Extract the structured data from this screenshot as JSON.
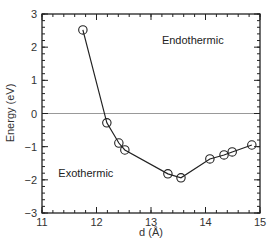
{
  "chart_data": {
    "type": "line",
    "title": "",
    "xlabel": "d (Å)",
    "ylabel": "Energy (eV)",
    "xlim": [
      11,
      15
    ],
    "ylim": [
      -3,
      3
    ],
    "xticks": [
      11,
      12,
      13,
      14,
      15
    ],
    "yticks": [
      -3,
      -2,
      -1,
      0,
      1,
      2,
      3
    ],
    "x_minor_step": 0.2,
    "y_minor_step": 0.2,
    "grid": false,
    "reference_line": {
      "y": 0,
      "color": "#999999"
    },
    "annotations": [
      {
        "text": "Endothermic",
        "x": 13.2,
        "y": 2.0
      },
      {
        "text": "Exothermic",
        "x": 11.3,
        "y": -2.0
      }
    ],
    "series": [
      {
        "name": "Energy",
        "marker": "open-circle",
        "color": "#222222",
        "x": [
          11.75,
          12.19,
          12.41,
          12.52,
          13.31,
          13.55,
          14.08,
          14.34,
          14.49,
          14.85
        ],
        "y": [
          2.52,
          -0.28,
          -0.89,
          -1.1,
          -1.82,
          -1.94,
          -1.37,
          -1.25,
          -1.16,
          -0.95
        ]
      }
    ]
  }
}
